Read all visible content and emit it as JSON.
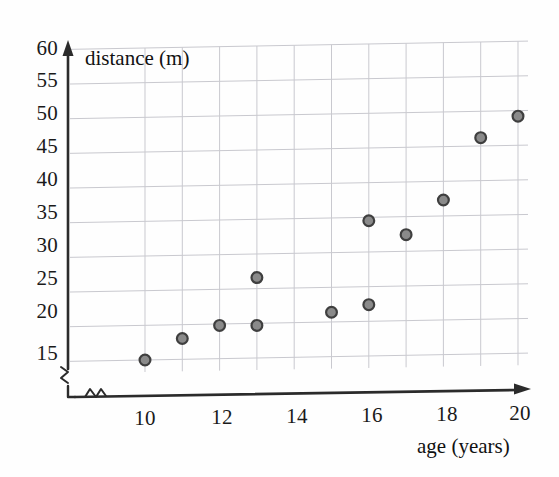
{
  "chart_data": {
    "type": "scatter",
    "title": "",
    "xlabel": "age (years)",
    "ylabel": "distance (m)",
    "xlim": [
      9,
      20.5
    ],
    "ylim": [
      13,
      60
    ],
    "grid": true,
    "legend": "none",
    "axis_break_x": true,
    "axis_break_y": true,
    "x_ticks": [
      10,
      12,
      14,
      16,
      18,
      20
    ],
    "x_tick_labels": [
      "10",
      "12",
      "14",
      "16",
      "18",
      "20"
    ],
    "y_ticks": [
      15,
      20,
      25,
      30,
      35,
      40,
      45,
      50,
      55,
      60
    ],
    "y_tick_labels": [
      "15",
      "20",
      "25",
      "30",
      "35",
      "40",
      "45",
      "50",
      "55",
      "60"
    ],
    "x_minor_gridlines": [
      11,
      13,
      15,
      17,
      19
    ],
    "series": [
      {
        "name": "age vs distance",
        "marker": "circle",
        "marker_fill": "#8a8a8a",
        "marker_edge": "#3f3f3f",
        "points": [
          {
            "x": 10,
            "y": 15.0
          },
          {
            "x": 11,
            "y": 18.0
          },
          {
            "x": 12,
            "y": 19.8
          },
          {
            "x": 13,
            "y": 19.7
          },
          {
            "x": 13,
            "y": 26.6
          },
          {
            "x": 15,
            "y": 21.4
          },
          {
            "x": 16,
            "y": 22.4
          },
          {
            "x": 16,
            "y": 34.5
          },
          {
            "x": 17,
            "y": 32.4
          },
          {
            "x": 18,
            "y": 37.3
          },
          {
            "x": 19,
            "y": 46.2
          },
          {
            "x": 20,
            "y": 49.2
          }
        ]
      }
    ]
  },
  "style": {
    "grid_color": "#c9c9cf",
    "axis_color": "#2b2b2b",
    "background": "#fefefe",
    "text_color": "#1a1a1a"
  }
}
